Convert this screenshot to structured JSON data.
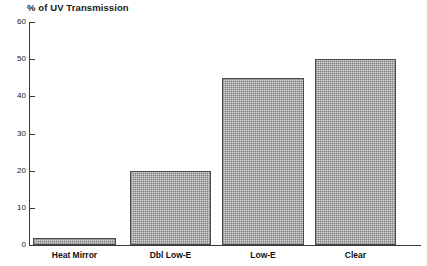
{
  "chart_data": {
    "type": "bar",
    "title": "% of UV Transmission",
    "xlabel": "",
    "ylabel": "",
    "categories": [
      "Heat Mirror",
      "Dbl Low-E",
      "Low-E",
      "Clear"
    ],
    "values": [
      2,
      20,
      45,
      50
    ],
    "ylim": [
      0,
      60
    ],
    "ytick_labels": [
      "0",
      "10",
      "20",
      "30",
      "40",
      "50",
      "60"
    ],
    "ytick_values": [
      0,
      10,
      20,
      30,
      40,
      50,
      60
    ],
    "grid": false,
    "legend": "none",
    "bar_fill_color": "#d9d9d9",
    "bar_edge_color": "#4a4a4a",
    "axis_color": "#3a3a3a",
    "text_color": "#111111",
    "background_color": "#ffffff"
  }
}
